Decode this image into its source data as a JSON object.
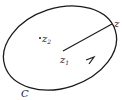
{
  "diagram": {
    "type": "contour",
    "contour_label": "C",
    "points": {
      "z1": {
        "label": "z",
        "subscript": "1"
      },
      "z2": {
        "label": "z",
        "subscript": "2"
      },
      "z": {
        "label": "z"
      }
    },
    "orientation": "counterclockwise",
    "colors": {
      "stroke": "#1a1a1a",
      "background": "#ffffff"
    }
  }
}
